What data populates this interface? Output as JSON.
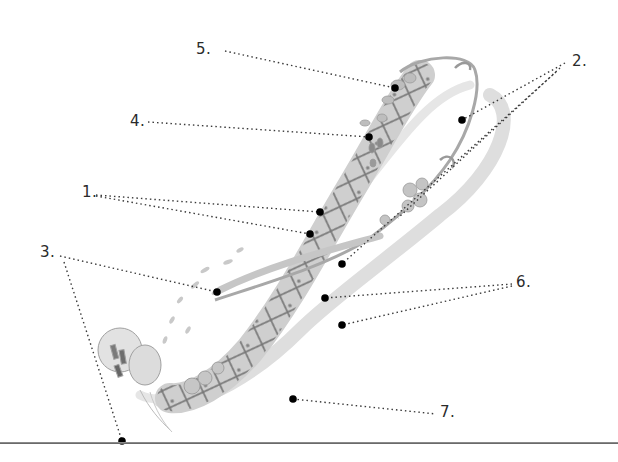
{
  "figure": {
    "colors": {
      "ink": "#2a2a2a",
      "dot": "#000000",
      "ribbon_light": "#d9d9d9",
      "ribbon_mid": "#b5b5b5",
      "ribbon_dark": "#6e6e6e",
      "rule": "#6a6a6a"
    }
  },
  "callouts": [
    {
      "label": "1.",
      "x": 82,
      "y": 162
    },
    {
      "label": "2.",
      "x": 572,
      "y": 45
    },
    {
      "label": "3.",
      "x": 40,
      "y": 207
    },
    {
      "label": "4.",
      "x": 130,
      "y": 93
    },
    {
      "label": "5.",
      "x": 196,
      "y": 35
    },
    {
      "label": "6.",
      "x": 518,
      "y": 236
    },
    {
      "label": "7.",
      "x": 444,
      "y": 355
    }
  ]
}
